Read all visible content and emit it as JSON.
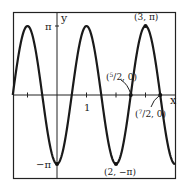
{
  "chart_data": {
    "type": "line",
    "title": "",
    "function": "y = -π cos(πx)",
    "xlabel": "x",
    "ylabel": "y",
    "xlim": [
      -1.5,
      4.0
    ],
    "ylim": [
      -3.6,
      3.6
    ],
    "grid": false,
    "legend": null,
    "x_ticks": [
      -1,
      1,
      2,
      3
    ],
    "x_tick_labels": [
      "",
      "1",
      "",
      ""
    ],
    "y_tick_labels": [
      "π",
      "−π"
    ],
    "series": [
      {
        "name": "y = -π cos(πx)",
        "x": [
          -1.5,
          -1,
          -0.5,
          0,
          0.5,
          1,
          1.5,
          2,
          2.5,
          3,
          3.5,
          4
        ],
        "y": [
          0,
          3.1416,
          0,
          -3.1416,
          0,
          3.1416,
          0,
          -3.1416,
          0,
          3.1416,
          0,
          -3.1416
        ]
      }
    ],
    "annotations": [
      {
        "label": "(3, π)",
        "x": 3,
        "y": 3.1416
      },
      {
        "label": "(5/2, 0)",
        "x": 2.5,
        "y": 0
      },
      {
        "label": "(7/2, 0)",
        "x": 3.5,
        "y": 0
      },
      {
        "label": "(2, −π)",
        "x": 2,
        "y": -3.1416
      },
      {
        "label": "−π",
        "x": 0,
        "y": -3.1416
      }
    ]
  },
  "labels": {
    "x_axis": "x",
    "y_axis": "y",
    "pi": "π",
    "neg_pi": "−π",
    "one": "1",
    "peak": "(3, π)",
    "trough": "(2, −π)",
    "zero_a_pre": "(",
    "zero_a_num": "5",
    "zero_a_post": "/2, 0)",
    "zero_b_pre": "(",
    "zero_b_num": "7",
    "zero_b_post": "/2, 0)"
  }
}
